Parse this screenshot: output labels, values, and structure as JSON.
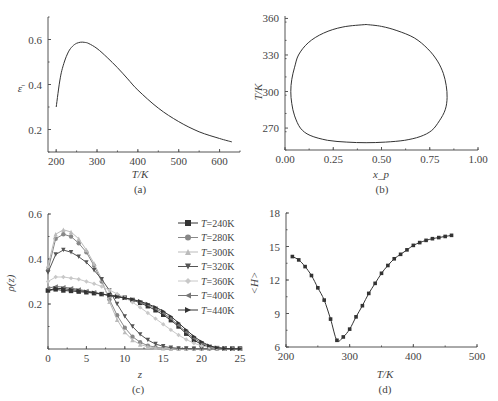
{
  "chart_data": [
    {
      "id": "a",
      "type": "line",
      "caption": "(a)",
      "xlabel": "T/K",
      "ylabel": "ε̄",
      "xlim": [
        180,
        650
      ],
      "ylim": [
        0.1,
        0.7
      ],
      "xticks": [
        "200",
        "300",
        "400",
        "500",
        "600"
      ],
      "yticks": [
        "0.2",
        "0.4",
        "0.6"
      ],
      "x": [
        200,
        210,
        220,
        230,
        240,
        250,
        260,
        270,
        280,
        300,
        325,
        350,
        375,
        400,
        450,
        500,
        550,
        600,
        630
      ],
      "y": [
        0.3,
        0.43,
        0.5,
        0.545,
        0.57,
        0.583,
        0.588,
        0.587,
        0.582,
        0.56,
        0.52,
        0.475,
        0.425,
        0.375,
        0.295,
        0.235,
        0.19,
        0.16,
        0.145
      ]
    },
    {
      "id": "b",
      "type": "line",
      "caption": "(b)",
      "xlabel": "x_p",
      "ylabel": "T/K",
      "xlim": [
        0.0,
        1.0
      ],
      "ylim": [
        252,
        362
      ],
      "xticks": [
        "0.00",
        "0.25",
        "0.50",
        "0.75",
        "1.00"
      ],
      "yticks": [
        "270",
        "300",
        "330",
        "360"
      ],
      "x": [
        0.42,
        0.3,
        0.2,
        0.12,
        0.07,
        0.05,
        0.035,
        0.03,
        0.035,
        0.05,
        0.08,
        0.13,
        0.22,
        0.32,
        0.42,
        0.52,
        0.62,
        0.7,
        0.76,
        0.8,
        0.83,
        0.84,
        0.835,
        0.82,
        0.79,
        0.74,
        0.67,
        0.58,
        0.5,
        0.42
      ],
      "y": [
        355,
        353,
        348,
        340,
        330,
        320,
        310,
        300,
        290,
        280,
        270,
        264,
        260,
        258.5,
        258,
        258.5,
        260,
        263,
        268,
        276,
        285,
        295,
        305,
        315,
        325,
        335,
        344,
        350,
        353.5,
        355
      ]
    },
    {
      "id": "c",
      "type": "line",
      "caption": "(c)",
      "xlabel": "z",
      "ylabel": "ρ(z)",
      "xlim": [
        0,
        25
      ],
      "ylim": [
        0,
        0.6
      ],
      "xticks": [
        "0",
        "5",
        "10",
        "15",
        "20",
        "25"
      ],
      "yticks": [
        "0.2",
        "0.4",
        "0.6"
      ],
      "legend_position": "upper right",
      "x": [
        0,
        1,
        2,
        3,
        4,
        5,
        6,
        7,
        8,
        9,
        10,
        11,
        12,
        13,
        14,
        15,
        16,
        17,
        18,
        19,
        20,
        21,
        22,
        23,
        24,
        25
      ],
      "series": [
        {
          "name": "T=240K",
          "marker": "square",
          "color": "#333333",
          "values": [
            0.26,
            0.265,
            0.26,
            0.258,
            0.255,
            0.252,
            0.248,
            0.244,
            0.24,
            0.235,
            0.228,
            0.218,
            0.205,
            0.19,
            0.172,
            0.152,
            0.128,
            0.1,
            0.068,
            0.04,
            0.02,
            0.008,
            0.004,
            0.002,
            0.001,
            0.001
          ]
        },
        {
          "name": "T=280K",
          "marker": "circle",
          "color": "#888888",
          "values": [
            0.35,
            0.49,
            0.51,
            0.5,
            0.47,
            0.43,
            0.37,
            0.3,
            0.22,
            0.15,
            0.095,
            0.055,
            0.03,
            0.015,
            0.008,
            0.004,
            0.002,
            0.001,
            0.001,
            0.001,
            0.001,
            0.001,
            0.001,
            0.001,
            0.001,
            0.001
          ]
        },
        {
          "name": "T=300K",
          "marker": "triangle-up",
          "color": "#bbbbbb",
          "values": [
            0.37,
            0.51,
            0.53,
            0.52,
            0.49,
            0.44,
            0.38,
            0.31,
            0.21,
            0.13,
            0.075,
            0.04,
            0.02,
            0.01,
            0.005,
            0.003,
            0.002,
            0.001,
            0.001,
            0.001,
            0.001,
            0.001,
            0.001,
            0.001,
            0.001,
            0.001
          ]
        },
        {
          "name": "T=320K",
          "marker": "triangle-down",
          "color": "#555555",
          "values": [
            0.34,
            0.42,
            0.44,
            0.43,
            0.41,
            0.385,
            0.35,
            0.31,
            0.26,
            0.2,
            0.145,
            0.1,
            0.065,
            0.04,
            0.022,
            0.012,
            0.006,
            0.003,
            0.002,
            0.001,
            0.001,
            0.001,
            0.001,
            0.001,
            0.001,
            0.001
          ]
        },
        {
          "name": "T=360K",
          "marker": "diamond",
          "color": "#c8c8c8",
          "values": [
            0.3,
            0.32,
            0.32,
            0.315,
            0.31,
            0.3,
            0.29,
            0.278,
            0.262,
            0.245,
            0.228,
            0.208,
            0.185,
            0.16,
            0.135,
            0.11,
            0.085,
            0.062,
            0.042,
            0.026,
            0.014,
            0.007,
            0.003,
            0.002,
            0.001,
            0.001
          ]
        },
        {
          "name": "T=400K",
          "marker": "triangle-left",
          "color": "#777777",
          "values": [
            0.27,
            0.278,
            0.275,
            0.27,
            0.265,
            0.258,
            0.252,
            0.245,
            0.238,
            0.232,
            0.226,
            0.218,
            0.208,
            0.196,
            0.18,
            0.16,
            0.135,
            0.105,
            0.075,
            0.048,
            0.026,
            0.012,
            0.005,
            0.002,
            0.001,
            0.001
          ]
        },
        {
          "name": "T=440K",
          "marker": "triangle-right",
          "color": "#333333",
          "values": [
            0.26,
            0.27,
            0.268,
            0.264,
            0.26,
            0.255,
            0.25,
            0.244,
            0.238,
            0.232,
            0.227,
            0.22,
            0.212,
            0.2,
            0.186,
            0.168,
            0.145,
            0.116,
            0.085,
            0.056,
            0.032,
            0.015,
            0.006,
            0.002,
            0.001,
            0.001
          ]
        }
      ]
    },
    {
      "id": "d",
      "type": "line",
      "caption": "(d)",
      "xlabel": "T/K",
      "ylabel": "<H>",
      "xlim": [
        200,
        500
      ],
      "ylim": [
        6,
        18
      ],
      "xticks": [
        "200",
        "300",
        "400",
        "500"
      ],
      "yticks": [
        "6",
        "9",
        "12",
        "15",
        "18"
      ],
      "marker": "square",
      "x": [
        210,
        220,
        230,
        240,
        250,
        260,
        270,
        280,
        290,
        300,
        310,
        320,
        330,
        340,
        350,
        360,
        370,
        380,
        390,
        400,
        410,
        420,
        430,
        440,
        450,
        460
      ],
      "y": [
        14.1,
        13.8,
        13.2,
        12.4,
        11.3,
        10.2,
        8.5,
        6.6,
        6.9,
        7.6,
        8.7,
        9.7,
        10.8,
        11.7,
        12.6,
        13.3,
        13.9,
        14.3,
        14.7,
        15.1,
        15.35,
        15.55,
        15.7,
        15.8,
        15.9,
        16.0
      ]
    }
  ]
}
